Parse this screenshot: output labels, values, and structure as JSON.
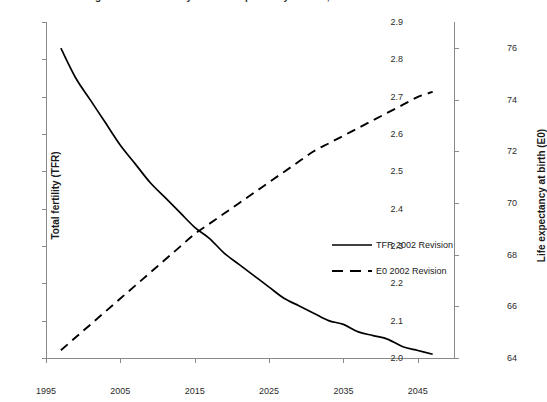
{
  "chart_data": {
    "type": "line",
    "title": "Figure 3. Total fertility and life expectancy at birth, India 1995-2050",
    "xlabel": "",
    "ylabel": "Total fertility (TFR)",
    "y2label": "Life expectancy at birth (E0)",
    "xlim": [
      1995,
      2050
    ],
    "ylim": [
      2.0,
      2.9
    ],
    "y2lim": [
      64,
      77
    ],
    "grid": false,
    "legend_position": "center-right",
    "x_ticks": [
      "1995",
      "2005",
      "2015",
      "2025",
      "2035",
      "2045"
    ],
    "x_tick_values": [
      1995,
      2005,
      2015,
      2025,
      2035,
      2045
    ],
    "y_ticks": [
      "2.0",
      "2.1",
      "2.2",
      "2.3",
      "2.4",
      "2.5",
      "2.6",
      "2.7",
      "2.8",
      "2.9"
    ],
    "y_tick_values": [
      2.0,
      2.1,
      2.2,
      2.3,
      2.4,
      2.5,
      2.6,
      2.7,
      2.8,
      2.9
    ],
    "y2_ticks": [
      "64",
      "66",
      "68",
      "70",
      "72",
      "74",
      "76"
    ],
    "y2_tick_values": [
      64,
      66,
      68,
      70,
      72,
      74,
      76
    ],
    "x": [
      1997,
      1999,
      2001,
      2003,
      2005,
      2007,
      2009,
      2011,
      2013,
      2015,
      2017,
      2019,
      2021,
      2023,
      2025,
      2027,
      2029,
      2031,
      2033,
      2035,
      2037,
      2039,
      2041,
      2043,
      2045,
      2047
    ],
    "series": [
      {
        "name": "TFR 2002 Revision",
        "axis": "left",
        "style": "solid",
        "color": "#000000",
        "values": [
          2.83,
          2.75,
          2.69,
          2.63,
          2.57,
          2.52,
          2.47,
          2.43,
          2.39,
          2.35,
          2.32,
          2.28,
          2.25,
          2.22,
          2.19,
          2.16,
          2.14,
          2.12,
          2.1,
          2.09,
          2.07,
          2.06,
          2.05,
          2.03,
          2.02,
          2.01
        ]
      },
      {
        "name": "E0 2002 Revision",
        "axis": "right",
        "style": "dashed",
        "color": "#000000",
        "values": [
          64.3,
          64.8,
          65.3,
          65.8,
          66.3,
          66.8,
          67.3,
          67.8,
          68.3,
          68.8,
          69.2,
          69.6,
          70.0,
          70.4,
          70.8,
          71.2,
          71.6,
          72.0,
          72.3,
          72.6,
          72.9,
          73.2,
          73.5,
          73.8,
          74.1,
          74.3
        ]
      }
    ],
    "annotations": [
      {
        "label": "crossing",
        "x": 2022,
        "y_left": 2.33,
        "y_right": 69.3
      }
    ]
  },
  "legend": {
    "items": [
      {
        "label": "TFR 2002 Revision",
        "style": "solid"
      },
      {
        "label": "E0 2002 Revision",
        "style": "dashed"
      }
    ]
  }
}
